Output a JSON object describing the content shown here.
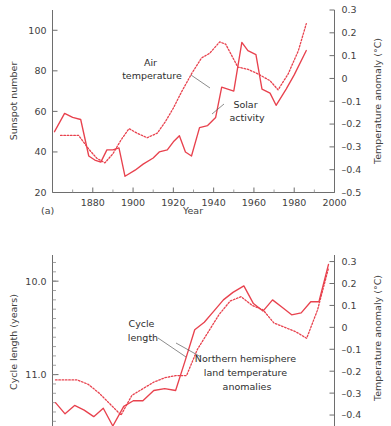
{
  "figure": {
    "panel_a_label": "(a)",
    "accent_color": "#e8424e",
    "axis_color": "#6e6e6e",
    "text_color": "#3f3f3f"
  },
  "chart_data": [
    {
      "id": "panel-a",
      "type": "line",
      "title": "",
      "xlabel": "Year",
      "ylabel": "Sunspot number",
      "y2label": "Temperature anomaly (°C)",
      "xlim": [
        1860,
        2000
      ],
      "ylim": [
        20,
        110
      ],
      "y2lim": [
        -0.5,
        0.3
      ],
      "xticks": [
        1880,
        1900,
        1920,
        1940,
        1960,
        1980,
        2000
      ],
      "xticklabels": [
        "1880",
        "1900",
        "1920",
        "1940",
        "1960",
        "1980",
        "2000"
      ],
      "yticks": [
        20,
        40,
        60,
        80,
        100
      ],
      "yticklabels": [
        "20",
        "40",
        "60",
        "80",
        "100"
      ],
      "y2ticks": [
        -0.5,
        -0.4,
        -0.3,
        -0.2,
        -0.1,
        0,
        0.1,
        0.2,
        0.3
      ],
      "y2ticklabels": [
        "–0.5",
        "–0.4",
        "–0.3",
        "–0.2",
        "–0.1",
        "0",
        "0.1",
        "0.2",
        "0.3"
      ],
      "grid": false,
      "legend": "annotations",
      "series": [
        {
          "name": "Solar activity",
          "style": "solid",
          "axis": "left",
          "x": [
            1861,
            1866,
            1870,
            1874,
            1878,
            1881,
            1884,
            1887,
            1890,
            1893,
            1896,
            1901,
            1905,
            1910,
            1913,
            1917,
            1920,
            1923,
            1926,
            1929,
            1933,
            1937,
            1941,
            1944,
            1947,
            1950,
            1954,
            1957,
            1961,
            1964,
            1968,
            1971,
            1976,
            1980,
            1986
          ],
          "values": [
            50,
            59,
            57,
            56,
            38,
            36,
            35,
            41,
            41,
            42,
            28,
            31,
            34,
            37,
            40,
            41,
            45,
            48,
            40,
            38,
            52,
            53,
            57,
            72,
            71,
            70,
            94,
            90,
            88,
            71,
            69,
            63,
            71,
            78,
            90
          ]
        },
        {
          "name": "Air temperature",
          "style": "dotted",
          "axis": "right",
          "x": [
            1864,
            1868,
            1873,
            1878,
            1882,
            1886,
            1890,
            1894,
            1898,
            1902,
            1907,
            1912,
            1916,
            1920,
            1924,
            1929,
            1934,
            1938,
            1943,
            1946,
            1952,
            1957,
            1962,
            1968,
            1972,
            1977,
            1982,
            1986
          ],
          "values": [
            -0.25,
            -0.25,
            -0.25,
            -0.31,
            -0.35,
            -0.37,
            -0.33,
            -0.27,
            -0.22,
            -0.24,
            -0.26,
            -0.24,
            -0.19,
            -0.13,
            -0.06,
            0.02,
            0.09,
            0.11,
            0.16,
            0.15,
            0.05,
            0.04,
            0.02,
            -0.01,
            -0.05,
            0.02,
            0.12,
            0.24
          ]
        }
      ],
      "annotations": [
        {
          "text_lines": [
            "Air",
            "temperature"
          ],
          "x_px": 145,
          "y_px": 66
        },
        {
          "text_lines": [
            "Solar",
            "activity"
          ],
          "x_px": 238,
          "y_px": 108
        }
      ]
    },
    {
      "id": "panel-b",
      "type": "line",
      "title": "",
      "xlabel": "",
      "ylabel": "Cycle length (years)",
      "y2label": "Temperature anomaly (°C)",
      "ylim": [
        11.55,
        9.72
      ],
      "y2lim": [
        -0.45,
        0.33
      ],
      "yticks": [
        10.0,
        11.0
      ],
      "yticklabels": [
        "10.0",
        "11.0"
      ],
      "y2ticks": [
        -0.4,
        -0.3,
        -0.2,
        -0.1,
        0,
        0.1,
        0.2,
        0.3
      ],
      "y2ticklabels": [
        "–0.4",
        "–0.3",
        "–0.2",
        "–0.1",
        "0",
        "0.1",
        "0.2",
        "0.3"
      ],
      "grid": false,
      "legend": "annotations",
      "series": [
        {
          "name": "Cycle length",
          "style": "solid",
          "axis": "left",
          "x": [
            0.0,
            0.035,
            0.07,
            0.105,
            0.14,
            0.175,
            0.21,
            0.25,
            0.285,
            0.32,
            0.36,
            0.4,
            0.44,
            0.475,
            0.51,
            0.545,
            0.58,
            0.615,
            0.65,
            0.69,
            0.725,
            0.76,
            0.795,
            0.83,
            0.865,
            0.9,
            0.935,
            0.965,
            1.0
          ],
          "values": [
            11.3,
            11.42,
            11.33,
            11.38,
            11.45,
            11.36,
            11.55,
            11.34,
            11.28,
            11.28,
            11.17,
            11.15,
            11.17,
            10.85,
            10.52,
            10.44,
            10.32,
            10.2,
            10.12,
            10.05,
            10.24,
            10.32,
            10.2,
            10.28,
            10.36,
            10.34,
            10.22,
            10.22,
            9.82
          ]
        },
        {
          "name": "Northern hemisphere land temperature anomalies",
          "style": "dotted",
          "axis": "right",
          "x": [
            0.0,
            0.04,
            0.08,
            0.12,
            0.16,
            0.2,
            0.24,
            0.28,
            0.32,
            0.36,
            0.4,
            0.44,
            0.48,
            0.52,
            0.56,
            0.6,
            0.64,
            0.68,
            0.72,
            0.76,
            0.8,
            0.84,
            0.88,
            0.92,
            0.96,
            1.0
          ],
          "values": [
            -0.24,
            -0.24,
            -0.24,
            -0.26,
            -0.3,
            -0.35,
            -0.4,
            -0.31,
            -0.28,
            -0.25,
            -0.23,
            -0.22,
            -0.22,
            -0.1,
            -0.02,
            0.06,
            0.12,
            0.14,
            0.1,
            0.08,
            0.02,
            0.0,
            -0.02,
            -0.05,
            0.08,
            0.27
          ]
        }
      ],
      "annotations": [
        {
          "text_lines": [
            "Cycle",
            "length"
          ],
          "x_px": 135,
          "y_px": 322
        },
        {
          "text_lines": [
            "Northern hemisphere",
            "land temperature",
            "anomalies"
          ],
          "x_px": 248,
          "y_px": 354
        }
      ]
    }
  ]
}
